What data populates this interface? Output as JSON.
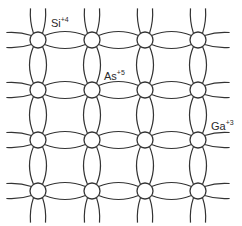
{
  "diagram": {
    "grid": {
      "columns_x": [
        38,
        92,
        145,
        198
      ],
      "rows_y": [
        40,
        90,
        140,
        191
      ],
      "atom_radius": 8,
      "stroke_color": "#333333"
    },
    "labels": [
      {
        "element": "Si",
        "charge": "+4",
        "x": 51,
        "y": 27
      },
      {
        "element": "As",
        "charge": "+5",
        "x": 104,
        "y": 80
      },
      {
        "element": "Ga",
        "charge": "+3",
        "x": 211,
        "y": 130
      }
    ]
  }
}
